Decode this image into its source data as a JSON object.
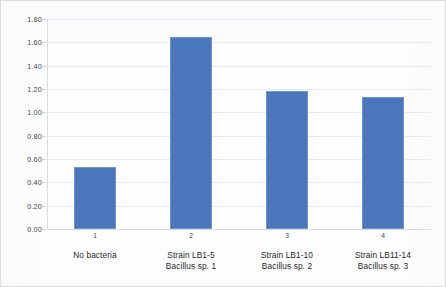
{
  "chart_data": {
    "type": "bar",
    "title": "",
    "subtitle": "",
    "xlabel": "",
    "ylabel": "",
    "ylim": [
      0.0,
      1.8
    ],
    "ytick_step": 0.2,
    "grid": true,
    "legend": "none",
    "categories": [
      "1",
      "2",
      "3",
      "4"
    ],
    "category_captions": [
      [
        "No bacteria",
        ""
      ],
      [
        "Strain LB1-5",
        "Bacillus sp. 1"
      ],
      [
        "Strain LB1-10",
        "Bacillus sp. 2"
      ],
      [
        "Strain LB11-14",
        "Bacillus sp. 3"
      ]
    ],
    "values": [
      0.53,
      1.65,
      1.18,
      1.13
    ],
    "ytick_labels": [
      "0.00",
      "0.20",
      "0.40",
      "0.60",
      "0.80",
      "1.00",
      "1.20",
      "1.40",
      "1.60",
      "1.80"
    ],
    "ytick_values": [
      0.0,
      0.2,
      0.4,
      0.6,
      0.8,
      1.0,
      1.2,
      1.4,
      1.6,
      1.8
    ],
    "colors": {
      "bar_fill": "#4a76bc",
      "bar_stroke": "#6d96d0",
      "gridline": "#e9ecef",
      "axis": "#d8dde2",
      "background": "#fdfdfd",
      "text": "#23282d"
    }
  }
}
